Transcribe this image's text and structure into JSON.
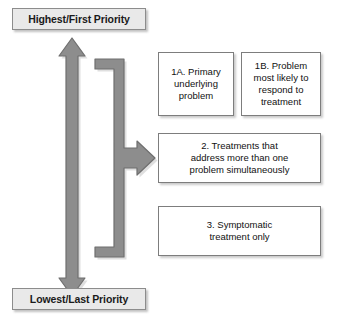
{
  "diagram": {
    "axis": {
      "top_label": "Highest/First Priority",
      "bottom_label": "Lowest/Last Priority",
      "direction": "vertical-double-headed",
      "meaning": "priority ranking from highest at top to lowest at bottom"
    },
    "boxes": [
      {
        "id": "1A",
        "text": "1A. Primary underlying problem",
        "lines": [
          "1A. Primary",
          "underlying",
          "problem"
        ],
        "tier": 1,
        "column": "left"
      },
      {
        "id": "1B",
        "text": "1B. Problem most likely to respond to treatment",
        "lines": [
          "1B. Problem",
          "most likely to",
          "respond to",
          "treatment"
        ],
        "tier": 1,
        "column": "right"
      },
      {
        "id": "2",
        "text": "2. Treatments that address more than one problem simultaneously",
        "lines": [
          "2. Treatments that",
          "address more than one",
          "problem simultaneously"
        ],
        "tier": 2,
        "column": "full"
      },
      {
        "id": "3",
        "text": "3. Symptomatic treatment only",
        "lines": [
          "3. Symptomatic",
          "treatment only"
        ],
        "tier": 3,
        "column": "full"
      }
    ],
    "connector": {
      "shape": "bracket-with-right-arrow",
      "points_to": "2"
    }
  },
  "colors": {
    "arrow_fill": "#8d8d8d",
    "arrow_stroke": "#6f6f6f",
    "label_fill": "#e9e9e9",
    "label_border": "#8c8c8c",
    "box_fill": "#ffffff",
    "box_border": "#7d7d7d",
    "text": "#111111",
    "background": "#ffffff"
  }
}
